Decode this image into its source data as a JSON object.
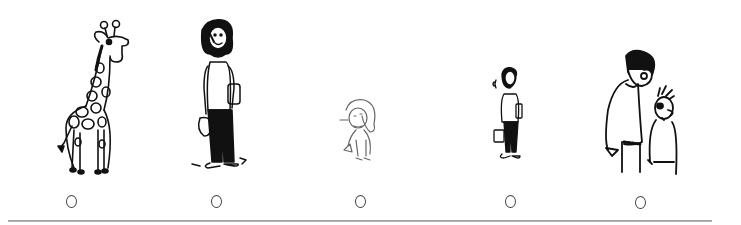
{
  "figures": [
    {
      "id": "giraffe",
      "label": "giraffe",
      "option_marker": "○"
    },
    {
      "id": "woman-tall",
      "label": "tall woman carrying books and bag",
      "option_marker": "○"
    },
    {
      "id": "small-girl",
      "label": "small girl picking up something",
      "option_marker": "○"
    },
    {
      "id": "woman-small",
      "label": "small woman carrying books and bag",
      "option_marker": "○"
    },
    {
      "id": "man-and-boy",
      "label": "tall man next to short boy",
      "option_marker": "○"
    }
  ],
  "colors": {
    "ink": "#111111",
    "rule": "#a0a0a0",
    "background": "#ffffff"
  }
}
